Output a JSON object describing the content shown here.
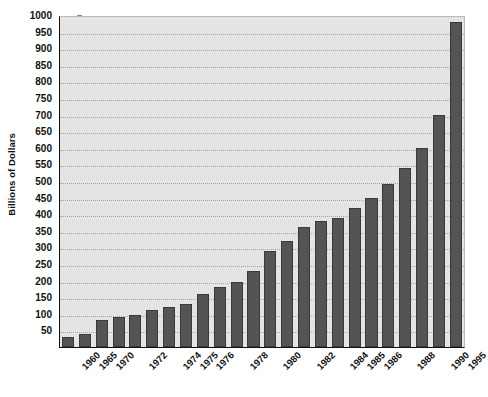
{
  "chart_data": {
    "type": "bar",
    "title": "",
    "xlabel": "",
    "ylabel": "Billions of Dollars",
    "ylim": [
      0,
      1000
    ],
    "grid": true,
    "legend": "none",
    "yticks": [
      1000,
      950,
      900,
      850,
      800,
      750,
      700,
      650,
      600,
      550,
      500,
      450,
      400,
      350,
      300,
      250,
      200,
      150,
      100,
      50
    ],
    "categories": [
      "1960",
      "1965",
      "1970",
      "1971",
      "1972",
      "1973",
      "1974",
      "1975",
      "1976",
      "1977",
      "1978",
      "1979",
      "1980",
      "1981",
      "1982",
      "1983",
      "1984",
      "1985",
      "1986",
      "1987",
      "1988",
      "1989",
      "1990",
      "1995"
    ],
    "tick_labels_visible": [
      "1960",
      "1965",
      "1970",
      "",
      "1972",
      "",
      "1974",
      "1975",
      "1976",
      "",
      "1978",
      "",
      "1980",
      "",
      "1982",
      "",
      "1984",
      "1985",
      "1986",
      "",
      "1988",
      "",
      "1990",
      "1995"
    ],
    "values": [
      30,
      40,
      80,
      90,
      95,
      110,
      120,
      130,
      160,
      180,
      195,
      230,
      290,
      320,
      360,
      380,
      390,
      420,
      450,
      490,
      540,
      600,
      700,
      980
    ]
  },
  "style": {
    "bar_color": "#545454",
    "plot_background": "#e4e4e4",
    "axis_color": "#111111",
    "grid_color": "#9a9a9a",
    "page_background": "#ffffff"
  }
}
